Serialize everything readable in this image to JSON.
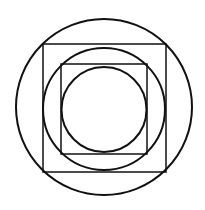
{
  "figure": {
    "background": "#ffffff",
    "stroke_color": "#111111",
    "shapes": [
      {
        "type": "circle",
        "name": "outer-circle",
        "cx": 104,
        "cy": 107,
        "r": 88,
        "stroke_width": 2
      },
      {
        "type": "rect",
        "name": "outer-square",
        "x": 43,
        "y": 44,
        "width": 123,
        "height": 128,
        "stroke_width": 1.5
      },
      {
        "type": "circle",
        "name": "middle-circle",
        "cx": 104,
        "cy": 109,
        "r": 61,
        "stroke_width": 2
      },
      {
        "type": "rect",
        "name": "inner-square",
        "x": 61,
        "y": 64,
        "width": 86,
        "height": 90,
        "stroke_width": 1.5
      },
      {
        "type": "circle",
        "name": "inner-circle",
        "cx": 104,
        "cy": 109.5,
        "r": 42.5,
        "stroke_width": 2
      }
    ]
  }
}
